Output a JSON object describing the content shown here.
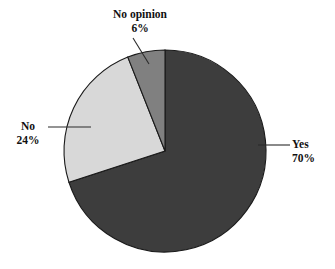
{
  "chart_data": {
    "type": "pie",
    "title": "",
    "categories": [
      "Yes",
      "No",
      "No opinion"
    ],
    "values": [
      70,
      24,
      6
    ],
    "value_unit": "%",
    "labels": [
      "70%",
      "24%",
      "6%"
    ],
    "colors": [
      "#3d3d3d",
      "#d8d8d8",
      "#808080"
    ],
    "start_angle_deg": 0,
    "direction": "clockwise",
    "legend": "none",
    "grid": false,
    "annotations": [
      {
        "name": "yes",
        "label": "Yes",
        "value_text": "70%",
        "leader": "horizontal-right"
      },
      {
        "name": "no",
        "label": "No",
        "value_text": "24%",
        "leader": "horizontal-left"
      },
      {
        "name": "no-opinion",
        "label": "No opinion",
        "value_text": "6%",
        "leader": "diagonal-top"
      }
    ]
  },
  "slices": {
    "yes": {
      "label": "Yes",
      "value_text": "70%",
      "color": "#3d3d3d"
    },
    "no": {
      "label": "No",
      "value_text": "24%",
      "color": "#d8d8d8"
    },
    "no_opinion": {
      "label": "No opinion",
      "value_text": "6%",
      "color": "#808080"
    }
  },
  "style": {
    "outline_color": "#1a1a1a",
    "leader_color": "#2b2b2b",
    "background": "#ffffff"
  }
}
